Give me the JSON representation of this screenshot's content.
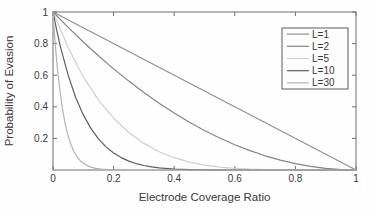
{
  "figure": {
    "background": "#fefefe",
    "frame_color": "#6e6e6e",
    "tick_color": "#6e6e6e",
    "text_color": "#3a3a3a",
    "legend_border_color": "#5a5a5a",
    "legend_background": "#fdfdfd"
  },
  "chart_data": {
    "type": "line",
    "title": "",
    "xlabel": "Electrode Coverage Ratio",
    "ylabel": "Probability of Evasion",
    "xlim": [
      0,
      1
    ],
    "ylim": [
      0,
      1
    ],
    "grid": false,
    "box": true,
    "tick_direction": "in",
    "legend_position": "top-right",
    "x_ticks": [
      0,
      0.2,
      0.4,
      0.6,
      0.8,
      1
    ],
    "x_tick_labels": [
      "0",
      "0.2",
      "0.4",
      "0.6",
      "0.8",
      "1"
    ],
    "y_ticks": [
      0.2,
      0.4,
      0.6,
      0.8,
      1
    ],
    "y_tick_labels": [
      "0.2",
      "0.4",
      "0.6",
      "0.8",
      "1"
    ],
    "series": [
      {
        "name": "L=1",
        "color": "#919191",
        "points": [
          [
            0,
            1
          ],
          [
            0.25,
            0.75
          ],
          [
            0.5,
            0.5
          ],
          [
            0.75,
            0.25
          ],
          [
            1,
            0
          ]
        ]
      },
      {
        "name": "L=2",
        "color": "#858585",
        "points": [
          [
            0,
            1
          ],
          [
            0.05,
            0.9025
          ],
          [
            0.1,
            0.81
          ],
          [
            0.15,
            0.7225
          ],
          [
            0.2,
            0.64
          ],
          [
            0.25,
            0.5625
          ],
          [
            0.3,
            0.49
          ],
          [
            0.35,
            0.4225
          ],
          [
            0.4,
            0.36
          ],
          [
            0.45,
            0.3025
          ],
          [
            0.5,
            0.25
          ],
          [
            0.55,
            0.2025
          ],
          [
            0.6,
            0.16
          ],
          [
            0.65,
            0.1225
          ],
          [
            0.7,
            0.09
          ],
          [
            0.75,
            0.0625
          ],
          [
            0.8,
            0.04
          ],
          [
            0.85,
            0.0225
          ],
          [
            0.9,
            0.01
          ],
          [
            0.95,
            0.0025
          ],
          [
            1,
            0
          ]
        ]
      },
      {
        "name": "L=5",
        "color": "#d0d0d0",
        "points": [
          [
            0,
            1
          ],
          [
            0.05,
            0.7738
          ],
          [
            0.1,
            0.5905
          ],
          [
            0.15,
            0.4437
          ],
          [
            0.2,
            0.3277
          ],
          [
            0.25,
            0.2373
          ],
          [
            0.3,
            0.1681
          ],
          [
            0.35,
            0.116
          ],
          [
            0.4,
            0.0778
          ],
          [
            0.45,
            0.0503
          ],
          [
            0.5,
            0.0313
          ],
          [
            0.55,
            0.0185
          ],
          [
            0.6,
            0.0102
          ],
          [
            0.65,
            0.0053
          ],
          [
            0.7,
            0.0024
          ],
          [
            0.75,
            0.001
          ],
          [
            0.8,
            0.0003
          ],
          [
            0.85,
            0.0001
          ],
          [
            0.9,
            0
          ],
          [
            1,
            0
          ]
        ]
      },
      {
        "name": "L=10",
        "color": "#5e5e5e",
        "points": [
          [
            0,
            1
          ],
          [
            0.0125,
            0.8818
          ],
          [
            0.025,
            0.7763
          ],
          [
            0.05,
            0.5987
          ],
          [
            0.075,
            0.4586
          ],
          [
            0.1,
            0.3487
          ],
          [
            0.125,
            0.2631
          ],
          [
            0.15,
            0.1969
          ],
          [
            0.175,
            0.146
          ],
          [
            0.2,
            0.1074
          ],
          [
            0.225,
            0.0782
          ],
          [
            0.25,
            0.0563
          ],
          [
            0.275,
            0.0401
          ],
          [
            0.3,
            0.0282
          ],
          [
            0.325,
            0.0196
          ],
          [
            0.35,
            0.0135
          ],
          [
            0.4,
            0.006
          ],
          [
            0.45,
            0.0025
          ],
          [
            0.5,
            0.001
          ],
          [
            0.6,
            0.0001
          ],
          [
            0.7,
            0
          ],
          [
            1,
            0
          ]
        ]
      },
      {
        "name": "L=30",
        "color": "#b4b4b4",
        "points": [
          [
            0,
            1
          ],
          [
            0.005,
            0.8604
          ],
          [
            0.01,
            0.7397
          ],
          [
            0.015,
            0.6355
          ],
          [
            0.02,
            0.5455
          ],
          [
            0.03,
            0.401
          ],
          [
            0.04,
            0.2939
          ],
          [
            0.05,
            0.2146
          ],
          [
            0.06,
            0.1563
          ],
          [
            0.07,
            0.1134
          ],
          [
            0.08,
            0.082
          ],
          [
            0.09,
            0.0591
          ],
          [
            0.1,
            0.0424
          ],
          [
            0.12,
            0.0216
          ],
          [
            0.14,
            0.0108
          ],
          [
            0.16,
            0.0054
          ],
          [
            0.18,
            0.0026
          ],
          [
            0.2,
            0.0012
          ],
          [
            0.25,
            0.0002
          ],
          [
            0.3,
            0
          ],
          [
            1,
            0
          ]
        ]
      }
    ]
  }
}
